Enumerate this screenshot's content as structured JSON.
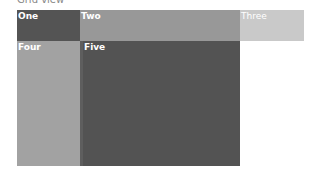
{
  "caption": "Grid view",
  "cells": [
    {
      "label": "One",
      "color": "#545454"
    },
    {
      "label": "Two",
      "color": "#989898"
    },
    {
      "label": "Three",
      "color": "#c9c9c9"
    },
    {
      "label": "Four",
      "color": "#a2a2a2"
    },
    {
      "label": "Five",
      "color": "#535353"
    }
  ]
}
